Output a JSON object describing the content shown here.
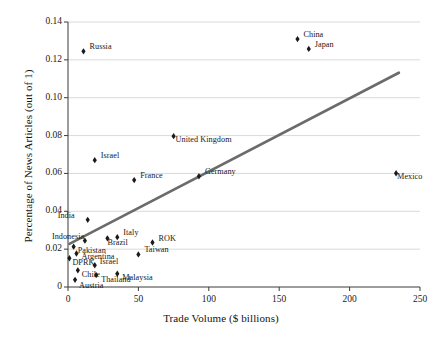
{
  "chart_data": {
    "type": "scatter",
    "title": "",
    "xlabel": "Trade Volume ($ billions)",
    "ylabel": "Percentage of News Articles (out of 1)",
    "xlim": [
      0,
      250
    ],
    "ylim": [
      0,
      0.14
    ],
    "xticks": [
      0,
      50,
      100,
      150,
      200,
      250
    ],
    "yticks": [
      0,
      0.02,
      0.04,
      0.06,
      0.08,
      0.1,
      0.12,
      0.14
    ],
    "xtick_labels": [
      "0",
      "50",
      "100",
      "150",
      "200",
      "250"
    ],
    "ytick_labels": [
      "0",
      "0.02",
      "0.04",
      "0.06",
      "0.08",
      "0.10",
      "0.12",
      "0.14"
    ],
    "grid": "horizontal",
    "legend": "none",
    "marker_color": "#1a1a1a",
    "trendline_color": "#6b6b6b",
    "gridline_color": "#c8c8c8",
    "axis_color": "#3a3a3a",
    "points": [
      {
        "label": "China",
        "x": 163,
        "y": 0.131,
        "label_dx": 6,
        "label_dy": -4
      },
      {
        "label": "Japan",
        "x": 171,
        "y": 0.1258,
        "label_dx": 6,
        "label_dy": -4
      },
      {
        "label": "Russia",
        "x": 11,
        "y": 0.1245,
        "label_dx": 6,
        "label_dy": -4
      },
      {
        "label": "United Kingdom",
        "x": 75,
        "y": 0.0797,
        "label_dx": 2,
        "label_dy": 4
      },
      {
        "label": "Israel",
        "x": 19,
        "y": 0.067,
        "label_dx": 6,
        "label_dy": -4
      },
      {
        "label": "Mexico",
        "x": 233,
        "y": 0.0601,
        "label_dx": 1,
        "label_dy": 4
      },
      {
        "label": "Germany",
        "x": 93,
        "y": 0.0585,
        "label_dx": 6,
        "label_dy": -4
      },
      {
        "label": "France",
        "x": 47,
        "y": 0.0565,
        "label_dx": 6,
        "label_dy": -4
      },
      {
        "label": "India",
        "x": 14,
        "y": 0.0355,
        "label_dx": -30,
        "label_dy": -4
      },
      {
        "label": "Italy",
        "x": 35,
        "y": 0.0263,
        "label_dx": 6,
        "label_dy": -4
      },
      {
        "label": "Brazil",
        "x": 28,
        "y": 0.0257,
        "label_dx": 0,
        "label_dy": 5
      },
      {
        "label": "Indonesia",
        "x": 12,
        "y": 0.0245,
        "label_dx": -33,
        "label_dy": -4
      },
      {
        "label": "ROK",
        "x": 60,
        "y": 0.0235,
        "label_dx": 6,
        "label_dy": -4
      },
      {
        "label": "Pakistan",
        "x": 4,
        "y": 0.0213,
        "label_dx": 4,
        "label_dy": 4
      },
      {
        "label": "Argentina",
        "x": 6,
        "y": 0.0177,
        "label_dx": 5,
        "label_dy": 4
      },
      {
        "label": "Taiwan",
        "x": 50,
        "y": 0.0172,
        "label_dx": 6,
        "label_dy": -4
      },
      {
        "label": "DPRK",
        "x": 1,
        "y": 0.0152,
        "label_dx": 3,
        "label_dy": 5
      },
      {
        "label": "Israel ",
        "x": 19,
        "y": 0.0115,
        "label_dx": 5,
        "label_dy": -3
      },
      {
        "label": "Chile",
        "x": 7,
        "y": 0.0088,
        "label_dx": 4,
        "label_dy": 5
      },
      {
        "label": "Malaysia",
        "x": 35,
        "y": 0.007,
        "label_dx": 5,
        "label_dy": 4
      },
      {
        "label": "Thailand",
        "x": 20,
        "y": 0.0063,
        "label_dx": 5,
        "label_dy": 5
      },
      {
        "label": "Austria",
        "x": 5,
        "y": 0.0038,
        "label_dx": 4,
        "label_dy": 6
      }
    ],
    "trendline": {
      "x0": 1,
      "y0": 0.0228,
      "x1": 235,
      "y1": 0.1132
    }
  }
}
